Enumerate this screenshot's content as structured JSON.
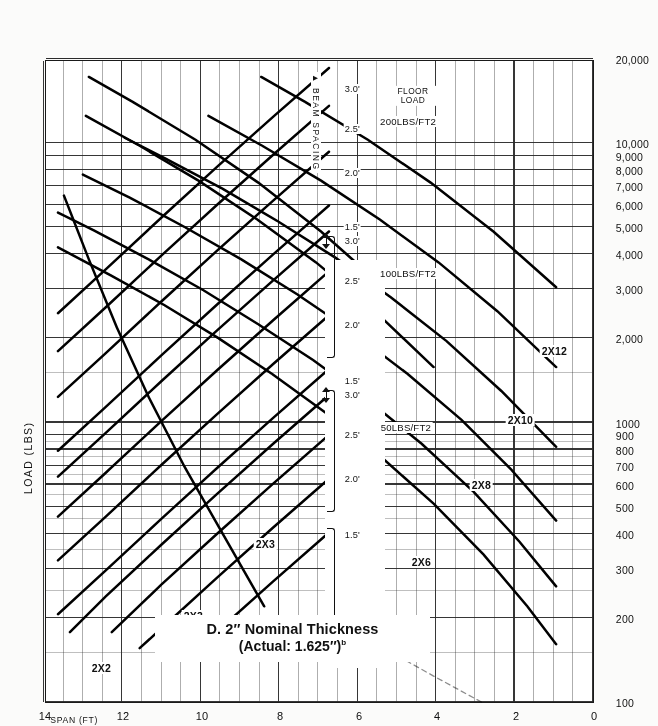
{
  "chart_data": {
    "type": "line",
    "subtitle": "(Actual: 1.625\")",
    "title_superscript": "b",
    "xlabel": "SPAN (FT)",
    "ylabel": "LOAD (LBS)",
    "x_scale": "linear",
    "y_scale": "log",
    "xlim": [
      0,
      14
    ],
    "ylim": [
      100,
      20000
    ],
    "x_direction": "reversed",
    "grid": true,
    "legend_position": "in-plot-curve-labels",
    "x_ticks": [
      "0",
      "2",
      "4",
      "6",
      "8",
      "10",
      "12",
      "14"
    ],
    "x_tick_values": [
      0,
      2,
      4,
      6,
      8,
      10,
      12,
      14
    ],
    "y_ticks": [
      "100",
      "200",
      "300",
      "400",
      "500",
      "600",
      "700",
      "800",
      "900",
      "1000",
      "2,000",
      "3,000",
      "4,000",
      "5,000",
      "6,000",
      "7,000",
      "8,000",
      "9,000",
      "10,000",
      "20,000"
    ],
    "y_tick_values": [
      100,
      200,
      300,
      400,
      500,
      600,
      700,
      800,
      900,
      1000,
      2000,
      3000,
      4000,
      5000,
      6000,
      7000,
      8000,
      9000,
      10000,
      20000
    ],
    "series": [
      {
        "name": "2X2",
        "label": "2X2",
        "kind": "capacity",
        "x": [
          1.0,
          1.5,
          2.0,
          2.5,
          3.0,
          3.5,
          4.0
        ],
        "y": [
          2300,
          1540,
          1160,
          930,
          770,
          660,
          580
        ]
      },
      {
        "name": "2X3",
        "label": "2X3",
        "kind": "capacity",
        "x": [
          1.5,
          2.5,
          3.5,
          4.5,
          5.5,
          6.5
        ],
        "y": [
          3450,
          2070,
          1480,
          1150,
          940,
          795
        ]
      },
      {
        "name": "2X4",
        "label": "2X4",
        "kind": "capacity",
        "x": [
          2.0,
          3.0,
          4.0,
          5.5,
          7.0,
          8.0
        ],
        "y": [
          4600,
          3070,
          2300,
          1670,
          1310,
          1150
        ]
      },
      {
        "name": "2X6",
        "label": "2X6",
        "kind": "capacity",
        "x": [
          3.0,
          5.0,
          7.0,
          9.0,
          11.0,
          12.5
        ],
        "y": [
          6900,
          4140,
          2960,
          2300,
          1880,
          1655
        ]
      },
      {
        "name": "2X8",
        "label": "2X8",
        "kind": "capacity",
        "x": [
          4.0,
          6.0,
          8.0,
          10.0,
          12.0,
          13.5
        ],
        "y": [
          9200,
          6130,
          4600,
          3680,
          3070,
          2725
        ]
      },
      {
        "name": "2X10",
        "label": "2X10",
        "kind": "capacity",
        "x": [
          5.0,
          7.0,
          9.0,
          11.0,
          13.0,
          14.0
        ],
        "y": [
          11500,
          8210,
          6390,
          5230,
          4420,
          4110
        ]
      },
      {
        "name": "2X12",
        "label": "2X12",
        "kind": "capacity",
        "x": [
          6.0,
          8.0,
          10.0,
          12.0,
          14.0
        ],
        "y": [
          13800,
          10350,
          8280,
          6900,
          5920
        ]
      },
      {
        "name": "50 LBS/FT2 floor load",
        "label": "50LBS/FT2",
        "kind": "load-family",
        "spacings": [
          "1.5'",
          "2.0'",
          "2.5'",
          "3.0'"
        ]
      },
      {
        "name": "100 LBS/FT2 floor load",
        "label": "100LBS/FT2",
        "kind": "load-family",
        "spacings": [
          "1.5'",
          "2.0'",
          "2.5'",
          "3.0'"
        ]
      },
      {
        "name": "200 LBS/FT2 floor load",
        "label": "200LBS/FT2",
        "kind": "load-family",
        "spacings": [
          "1.5'",
          "2.0'",
          "2.5'",
          "3.0'"
        ]
      }
    ],
    "annotations": [
      {
        "text": "FLOOR LOAD",
        "kind": "axis-caption"
      },
      {
        "text": "BEAM SPACING",
        "kind": "axis-caption"
      }
    ]
  },
  "chart": {
    "title_line1": "D. 2″ Nominal Thickness",
    "title_line2": "(Actual: 1.625″)",
    "title_sup": "b",
    "x_axis_label": "SPAN (FT)",
    "y_axis_label": "LOAD (LBS)",
    "x_ticks": [
      "0",
      "2",
      "4",
      "6",
      "8",
      "10",
      "12",
      "14"
    ],
    "y_ticks": [
      "100",
      "200",
      "300",
      "400",
      "500",
      "600",
      "700",
      "800",
      "900",
      "1000",
      "2,000",
      "3,000",
      "4,000",
      "5,000",
      "6,000",
      "7,000",
      "8,000",
      "9,000",
      "10,000",
      "20,000"
    ],
    "curve_labels": {
      "c2x2": "2X2",
      "c2x3a": "2X3",
      "c2x3b": "2X3",
      "c2x4a": "2X4",
      "c2x4b": "2X4",
      "c2x6": "2X6",
      "c2x8": "2X8",
      "c2x10": "2X10",
      "c2x12": "2X12"
    },
    "load_families": {
      "f50": "50LBS/FT2",
      "f100": "100LBS/FT2",
      "f200": "200LBS/FT2"
    },
    "spacing_values": {
      "a15": "1.5'",
      "a20": "2.0'",
      "a25": "2.5'",
      "a30": "3.0'",
      "b15": "1.5'",
      "b20": "2.0'",
      "b25": "2.5'",
      "b30": "3.0'",
      "c15": "1.5'",
      "c20": "2.0'",
      "c25": "2.5'",
      "c30": "3.0'"
    },
    "captions": {
      "floor_load_l1": "FLOOR",
      "floor_load_l2": "LOAD",
      "beam_spacing": "BEAM SPACING"
    }
  },
  "colors": {
    "ink": "#111111",
    "grid": "#2b2b2b",
    "paper": "#fbfbfa",
    "plot_bg": "#ffffff"
  }
}
